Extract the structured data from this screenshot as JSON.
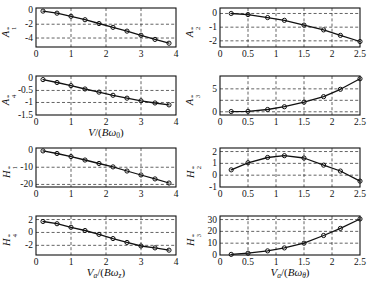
{
  "figure": {
    "colors": {
      "ink": "#111111",
      "grid": "#3c3c3c",
      "background": "#ffffff"
    }
  },
  "chart_data": [
    {
      "id": "A1",
      "type": "line",
      "ylabel": {
        "letter": "A",
        "sub": "1",
        "sup": "*"
      },
      "xlabel": null,
      "xlim": [
        0,
        4
      ],
      "ylim": [
        -5.3,
        0.35
      ],
      "xticks": {
        "values": [
          0,
          1,
          2,
          3,
          4
        ],
        "labels": [
          "0",
          "1",
          "2",
          "3",
          "4"
        ]
      },
      "yticks": {
        "values": [
          0,
          -2,
          -4
        ],
        "labels": [
          "0",
          "-2",
          "-4"
        ]
      },
      "xgrid": [
        1,
        2,
        3
      ],
      "ygrid": [
        -2,
        -4
      ],
      "x": [
        0.2,
        0.6,
        1.0,
        1.4,
        1.8,
        2.2,
        2.6,
        3.0,
        3.4,
        3.8
      ],
      "y": [
        -0.1,
        -0.4,
        -0.85,
        -1.35,
        -1.9,
        -2.45,
        -3.0,
        -3.6,
        -4.2,
        -4.75
      ]
    },
    {
      "id": "A2",
      "type": "line",
      "ylabel": {
        "letter": "A",
        "sub": "2",
        "sup": "*"
      },
      "xlabel": null,
      "xlim": [
        0,
        2.5
      ],
      "ylim": [
        -2.45,
        0.4
      ],
      "xticks": {
        "values": [
          0,
          0.5,
          1,
          1.5,
          2,
          2.5
        ],
        "labels": [
          "0",
          "0.5",
          "1",
          "1.5",
          "2",
          "2.5"
        ]
      },
      "yticks": {
        "values": [
          0,
          -1,
          -2
        ],
        "labels": [
          "0",
          "-1",
          "-2"
        ]
      },
      "xgrid": [
        0.5,
        1,
        1.5,
        2
      ],
      "ygrid": [
        0,
        -1,
        -2
      ],
      "x": [
        0.2,
        0.5,
        0.85,
        1.15,
        1.5,
        1.85,
        2.15,
        2.5
      ],
      "y": [
        0.0,
        -0.08,
        -0.3,
        -0.5,
        -0.85,
        -1.2,
        -1.6,
        -2.05
      ]
    },
    {
      "id": "A4",
      "type": "line",
      "ylabel": {
        "letter": "A",
        "sub": "4",
        "sup": "*"
      },
      "xlabel": [
        {
          "t": "V",
          "i": 1
        },
        {
          "t": "/("
        },
        {
          "t": "B",
          "i": 1
        },
        {
          "t": "ω",
          "i": 1
        },
        {
          "t": "0",
          "sub": 1
        },
        {
          "t": ")"
        }
      ],
      "xlim": [
        0,
        4
      ],
      "ylim": [
        -1.52,
        0.1
      ],
      "xticks": {
        "values": [
          0,
          1,
          2,
          3,
          4
        ],
        "labels": [
          "0",
          "1",
          "2",
          "3",
          "4"
        ]
      },
      "yticks": {
        "values": [
          0,
          -0.5,
          -1,
          -1.5
        ],
        "labels": [
          "0",
          "-0.5",
          "-1",
          "-1.5"
        ]
      },
      "xgrid": [
        1,
        2,
        3
      ],
      "ygrid": [
        -0.5,
        -1
      ],
      "x": [
        0.2,
        0.6,
        1.0,
        1.4,
        1.8,
        2.2,
        2.6,
        3.0,
        3.4,
        3.8
      ],
      "y": [
        -0.05,
        -0.17,
        -0.3,
        -0.44,
        -0.57,
        -0.7,
        -0.82,
        -0.93,
        -1.02,
        -1.1
      ]
    },
    {
      "id": "A3",
      "type": "line",
      "ylabel": {
        "letter": "A",
        "sub": "3",
        "sup": "*"
      },
      "xlabel": null,
      "xlim": [
        0,
        2.5
      ],
      "ylim": [
        -0.7,
        7.8
      ],
      "xticks": {
        "values": [
          0,
          0.5,
          1,
          1.5,
          2,
          2.5
        ],
        "labels": [
          "0",
          "0.5",
          "1",
          "1.5",
          "2",
          "2.5"
        ]
      },
      "yticks": {
        "values": [
          0,
          5
        ],
        "labels": [
          "0",
          "5"
        ]
      },
      "xgrid": [
        0.5,
        1,
        1.5,
        2
      ],
      "ygrid": [
        0,
        2.5,
        5
      ],
      "x": [
        0.2,
        0.5,
        0.85,
        1.15,
        1.5,
        1.85,
        2.15,
        2.5
      ],
      "y": [
        0.05,
        0.1,
        0.5,
        1.1,
        2.1,
        3.3,
        4.9,
        7.2
      ]
    },
    {
      "id": "H1",
      "type": "line",
      "ylabel": {
        "letter": "H",
        "sub": "1",
        "sup": "*"
      },
      "xlabel": null,
      "xlim": [
        0,
        4
      ],
      "ylim": [
        -21.5,
        1.2
      ],
      "xticks": {
        "values": [
          0,
          1,
          2,
          3,
          4
        ],
        "labels": [
          "0",
          "1",
          "2",
          "3",
          "4"
        ]
      },
      "yticks": {
        "values": [
          0,
          -10,
          -20
        ],
        "labels": [
          "0",
          "-10",
          "-20"
        ]
      },
      "xgrid": [
        1,
        2,
        3
      ],
      "ygrid": [
        -10,
        -20
      ],
      "x": [
        0.2,
        0.6,
        1.0,
        1.4,
        1.8,
        2.2,
        2.6,
        3.0,
        3.4,
        3.8
      ],
      "y": [
        -0.5,
        -2.0,
        -3.8,
        -5.8,
        -7.8,
        -9.8,
        -12.2,
        -14.5,
        -16.8,
        -19.2
      ]
    },
    {
      "id": "H2",
      "type": "line",
      "ylabel": {
        "letter": "H",
        "sub": "2",
        "sup": "*"
      },
      "xlabel": null,
      "xlim": [
        0,
        2.5
      ],
      "ylim": [
        -1.0,
        2.3
      ],
      "xticks": {
        "values": [
          0,
          0.5,
          1,
          1.5,
          2,
          2.5
        ],
        "labels": [
          "0",
          "0.5",
          "1",
          "1.5",
          "2",
          "2.5"
        ]
      },
      "yticks": {
        "values": [
          2,
          1,
          0,
          -1
        ],
        "labels": [
          "2",
          "1",
          "0",
          "-1"
        ]
      },
      "xgrid": [
        0.5,
        1,
        1.5,
        2
      ],
      "ygrid": [
        2,
        1,
        0
      ],
      "x": [
        0.2,
        0.5,
        0.85,
        1.15,
        1.5,
        1.85,
        2.15,
        2.5
      ],
      "y": [
        0.45,
        1.05,
        1.5,
        1.65,
        1.45,
        0.85,
        0.35,
        -0.5
      ]
    },
    {
      "id": "H4",
      "type": "line",
      "ylabel": {
        "letter": "H",
        "sub": "4",
        "sup": "*"
      },
      "xlabel": [
        {
          "t": "V",
          "i": 1
        },
        {
          "t": "a",
          "i": 1,
          "sub": 1
        },
        {
          "t": "/("
        },
        {
          "t": "B",
          "i": 1
        },
        {
          "t": "ω",
          "i": 1
        },
        {
          "t": "z",
          "i": 1,
          "sub": 1
        },
        {
          "t": ")"
        }
      ],
      "xlim": [
        0,
        4
      ],
      "ylim": [
        -3.5,
        2.55
      ],
      "xticks": {
        "values": [
          0,
          1,
          2,
          3,
          4
        ],
        "labels": [
          "0",
          "1",
          "2",
          "3",
          "4"
        ]
      },
      "yticks": {
        "values": [
          2,
          0,
          -2
        ],
        "labels": [
          "2",
          "0",
          "-2"
        ]
      },
      "xgrid": [
        1,
        2,
        3
      ],
      "ygrid": [
        2,
        0,
        -2
      ],
      "x": [
        0.2,
        0.6,
        1.0,
        1.4,
        1.8,
        2.2,
        2.6,
        3.0,
        3.4,
        3.8
      ],
      "y": [
        1.7,
        1.35,
        0.8,
        0.3,
        -0.3,
        -0.95,
        -1.55,
        -2.1,
        -2.4,
        -2.75
      ]
    },
    {
      "id": "H3",
      "type": "line",
      "ylabel": {
        "letter": "H",
        "sub": "3",
        "sup": "*"
      },
      "xlabel": [
        {
          "t": "V",
          "i": 1
        },
        {
          "t": "a",
          "i": 1,
          "sub": 1
        },
        {
          "t": "/("
        },
        {
          "t": "B",
          "i": 1
        },
        {
          "t": "ω",
          "i": 1
        },
        {
          "t": "θ",
          "i": 1,
          "sub": 1
        },
        {
          "t": ")"
        }
      ],
      "xlim": [
        0,
        2.5
      ],
      "ylim": [
        0,
        33
      ],
      "xticks": {
        "values": [
          0,
          0.5,
          1,
          1.5,
          2,
          2.5
        ],
        "labels": [
          "0",
          "0.5",
          "1",
          "1.5",
          "2",
          "2.5"
        ]
      },
      "yticks": {
        "values": [
          0,
          10,
          20,
          30
        ],
        "labels": [
          "0",
          "10",
          "20",
          "30"
        ]
      },
      "xgrid": [
        0.5,
        1,
        1.5,
        2
      ],
      "ygrid": [
        10,
        20,
        30
      ],
      "x": [
        0.2,
        0.5,
        0.85,
        1.15,
        1.5,
        1.85,
        2.15,
        2.5
      ],
      "y": [
        0.5,
        1.5,
        3.5,
        6.0,
        10.0,
        16.5,
        22.5,
        30.5
      ]
    }
  ]
}
